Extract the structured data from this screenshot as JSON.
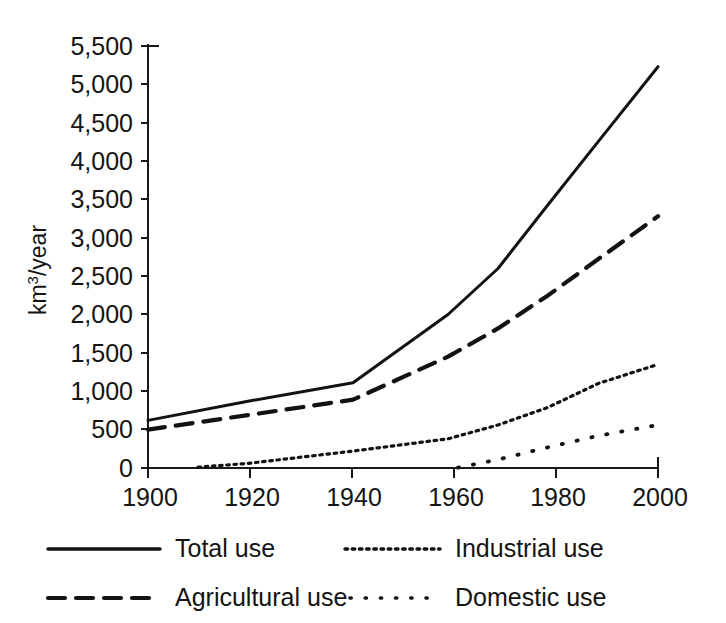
{
  "chart_data": {
    "type": "line",
    "title": "",
    "subtitle": "",
    "xlabel": "",
    "ylabel": "km3/year",
    "ylabel_base": "km",
    "ylabel_sup": "3",
    "ylabel_tail": "/year",
    "xlim": [
      1900,
      2002
    ],
    "ylim": [
      0,
      5500
    ],
    "grid": false,
    "legend_position": "bottom",
    "x_ticks": [
      1900,
      1920,
      1940,
      1960,
      1980,
      2000
    ],
    "x_tick_labels": [
      "1900",
      "1920",
      "1940",
      "1960",
      "1980",
      "2000"
    ],
    "y_ticks": [
      0,
      500,
      1000,
      1500,
      2000,
      2500,
      3000,
      3500,
      4000,
      4500,
      5000,
      5500
    ],
    "y_tick_labels": [
      "0",
      "500",
      "1,000",
      "1,500",
      "2,000",
      "2,500",
      "3,000",
      "3,500",
      "4,000",
      "4,500",
      "5,000",
      "5,500"
    ],
    "series": [
      {
        "name": "Total use",
        "style": "solid",
        "x": [
          1900,
          1920,
          1941,
          1960,
          1970,
          1980,
          1990,
          2002
        ],
        "values": [
          620,
          870,
          1110,
          2000,
          2600,
          3430,
          4250,
          5230
        ]
      },
      {
        "name": "Agricultural use",
        "style": "dashed",
        "x": [
          1900,
          1920,
          1941,
          1960,
          1970,
          1980,
          1990,
          2002
        ],
        "values": [
          500,
          690,
          890,
          1450,
          1820,
          2250,
          2720,
          3280
        ]
      },
      {
        "name": "Industrial use",
        "style": "dotted-fine",
        "x": [
          1910,
          1920,
          1941,
          1960,
          1970,
          1980,
          1990,
          2002
        ],
        "values": [
          10,
          60,
          220,
          380,
          560,
          790,
          1100,
          1350
        ]
      },
      {
        "name": "Domestic use",
        "style": "dotted-sparse",
        "x": [
          1962,
          1970,
          1980,
          1990,
          2002
        ],
        "values": [
          5,
          110,
          270,
          420,
          560
        ]
      }
    ],
    "legend": [
      {
        "label": "Total use",
        "style": "solid"
      },
      {
        "label": "Industrial use",
        "style": "dotted-fine"
      },
      {
        "label": "Agricultural use",
        "style": "dashed"
      },
      {
        "label": "Domestic use",
        "style": "dotted-sparse"
      }
    ],
    "colors": {
      "line": "#121212",
      "axis": "#1a1a1a",
      "text": "#141414",
      "background": "#ffffff"
    }
  }
}
